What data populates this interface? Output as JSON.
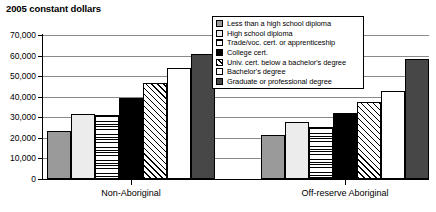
{
  "chart_data": {
    "type": "bar",
    "title": "2005 constant dollars",
    "xlabel": "",
    "ylabel": "",
    "ylim": [
      0,
      70000
    ],
    "ytick_labels": [
      "70,000",
      "60,000",
      "50,000",
      "40,000",
      "30,000",
      "20,000",
      "10,000",
      "0"
    ],
    "ytick_values": [
      70000,
      60000,
      50000,
      40000,
      30000,
      20000,
      10000,
      0
    ],
    "grid": true,
    "legend_position": "top-right",
    "categories": [
      "Non-Aboriginal",
      "Off-reserve Aboriginal"
    ],
    "series": [
      {
        "name": "Less than a high school diploma",
        "pattern": "solid-gray",
        "values": [
          23500,
          21500
        ]
      },
      {
        "name": "High school diploma",
        "pattern": "solid-light",
        "values": [
          31500,
          27500
        ]
      },
      {
        "name": "Trade/voc. cert. or apprenticeship",
        "pattern": "horizontal-lines",
        "values": [
          31000,
          25500
        ]
      },
      {
        "name": "College cert.",
        "pattern": "solid-black",
        "values": [
          39500,
          32000
        ]
      },
      {
        "name": "Univ. cert. below a bachelor's degree",
        "pattern": "diagonal-hatch",
        "values": [
          46500,
          37500
        ]
      },
      {
        "name": "Bachelor's degree",
        "pattern": "solid-white",
        "values": [
          54000,
          43000
        ]
      },
      {
        "name": "Graduate or professional degree",
        "pattern": "solid-dark-gray",
        "values": [
          61000,
          58500
        ]
      }
    ]
  },
  "legend": {
    "items": [
      {
        "label": "Less than a high school diploma"
      },
      {
        "label": "High school diploma"
      },
      {
        "label": "Trade/voc. cert. or apprenticeship"
      },
      {
        "label": "College cert."
      },
      {
        "label": "Univ. cert. below a bachelor's degree"
      },
      {
        "label": "Bachelor's degree"
      },
      {
        "label": "Graduate or professional degree"
      }
    ]
  },
  "colors": {
    "gray": "#9a9a9a",
    "light": "#ececec",
    "black": "#000000",
    "white": "#ffffff",
    "dark_gray": "#474747",
    "gridline": "#8a8a8a",
    "axis": "#000000"
  }
}
